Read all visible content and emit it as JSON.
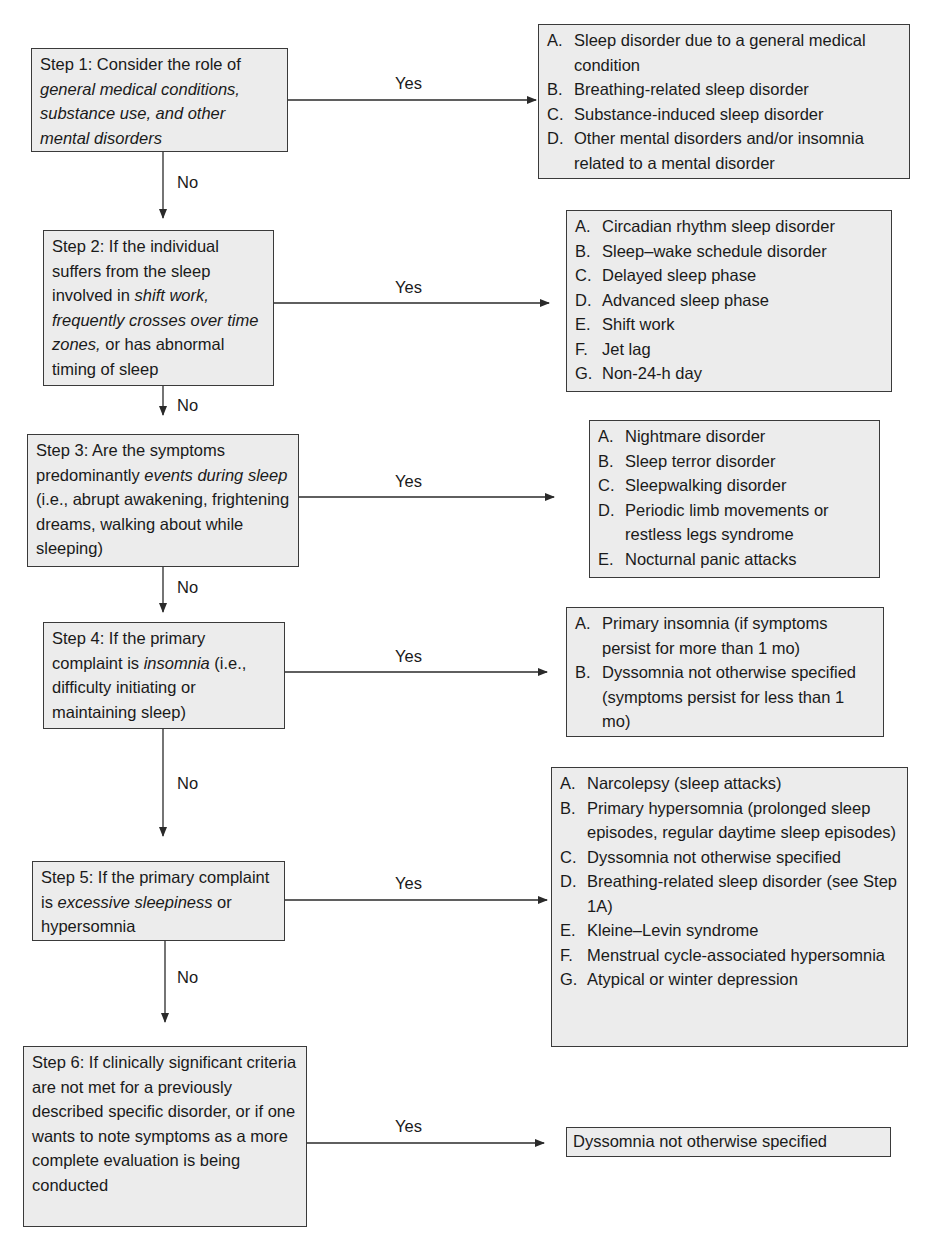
{
  "diagram": {
    "type": "flowchart",
    "steps": [
      {
        "id": "step-1",
        "segments": [
          {
            "text": "Step 1: Consider the role of ",
            "italic": false
          },
          {
            "text": "general medical conditions, substance use, and other mental disorders",
            "italic": true
          }
        ]
      },
      {
        "id": "step-2",
        "segments": [
          {
            "text": "Step 2: If the individual suffers from the sleep involved in ",
            "italic": false
          },
          {
            "text": "shift work, frequently crosses over time zones,",
            "italic": true
          },
          {
            "text": " or has abnormal timing of sleep",
            "italic": false
          }
        ]
      },
      {
        "id": "step-3",
        "segments": [
          {
            "text": "Step 3: Are the symptoms predominantly ",
            "italic": false
          },
          {
            "text": "events during sleep",
            "italic": true
          },
          {
            "text": " (i.e., abrupt awakening, frightening dreams, walking about while sleeping)",
            "italic": false
          }
        ]
      },
      {
        "id": "step-4",
        "segments": [
          {
            "text": "Step 4: If the primary complaint is ",
            "italic": false
          },
          {
            "text": "insomnia",
            "italic": true
          },
          {
            "text": " (i.e., difficulty initiating or maintaining sleep)",
            "italic": false
          }
        ]
      },
      {
        "id": "step-5",
        "segments": [
          {
            "text": "Step 5: If the primary complaint is ",
            "italic": false
          },
          {
            "text": "excessive sleepiness",
            "italic": true
          },
          {
            "text": " or hypersomnia",
            "italic": false
          }
        ]
      },
      {
        "id": "step-6",
        "segments": [
          {
            "text": "Step 6: If clinically significant criteria are not met for a previously described specific disorder, or if one wants to note symptoms as a more complete evaluation is being conducted",
            "italic": false
          }
        ]
      }
    ],
    "results": [
      {
        "id": "result-1",
        "items": [
          {
            "letter": "A.",
            "text": "Sleep disorder due to a general medical condition"
          },
          {
            "letter": "B.",
            "text": "Breathing-related sleep disorder"
          },
          {
            "letter": "C.",
            "text": "Substance-induced sleep disorder"
          },
          {
            "letter": "D.",
            "text": "Other mental disorders and/or insomnia related to a mental disorder"
          }
        ]
      },
      {
        "id": "result-2",
        "items": [
          {
            "letter": "A.",
            "text": "Circadian rhythm sleep disorder"
          },
          {
            "letter": "B.",
            "text": "Sleep–wake schedule disorder"
          },
          {
            "letter": "C.",
            "text": "Delayed sleep phase"
          },
          {
            "letter": "D.",
            "text": "Advanced sleep phase"
          },
          {
            "letter": "E.",
            "text": "Shift work"
          },
          {
            "letter": "F.",
            "text": "Jet lag"
          },
          {
            "letter": "G.",
            "text": "Non-24-h day"
          }
        ]
      },
      {
        "id": "result-3",
        "items": [
          {
            "letter": "A.",
            "text": "Nightmare disorder"
          },
          {
            "letter": "B.",
            "text": "Sleep terror disorder"
          },
          {
            "letter": "C.",
            "text": "Sleepwalking disorder"
          },
          {
            "letter": "D.",
            "text": "Periodic limb movements or restless legs syndrome"
          },
          {
            "letter": "E.",
            "text": "Nocturnal panic attacks"
          }
        ]
      },
      {
        "id": "result-4",
        "items": [
          {
            "letter": "A.",
            "text": "Primary insomnia (if symptoms persist for more than 1 mo)"
          },
          {
            "letter": "B.",
            "text": "Dyssomnia not otherwise specified (symptoms persist for less than 1 mo)"
          }
        ]
      },
      {
        "id": "result-5",
        "items": [
          {
            "letter": "A.",
            "text": "Narcolepsy (sleep attacks)"
          },
          {
            "letter": "B.",
            "text": "Primary hypersomnia (prolonged sleep episodes, regular daytime sleep episodes)"
          },
          {
            "letter": "C.",
            "text": "Dyssomnia not otherwise specified"
          },
          {
            "letter": "D.",
            "text": "Breathing-related sleep disorder (see Step 1A)"
          },
          {
            "letter": "E.",
            "text": "Kleine–Levin syndrome"
          },
          {
            "letter": "F.",
            "text": "Menstrual cycle-associated hypersomnia"
          },
          {
            "letter": "G.",
            "text": "Atypical or winter depression"
          }
        ]
      },
      {
        "id": "result-6",
        "text": "Dyssomnia not otherwise specified"
      }
    ],
    "edge_labels": {
      "yes": "Yes",
      "no": "No"
    },
    "colors": {
      "box_fill": "#ececec",
      "box_border": "#3a3a3a",
      "line": "#2a2a2a",
      "text": "#1a1a1a"
    }
  }
}
